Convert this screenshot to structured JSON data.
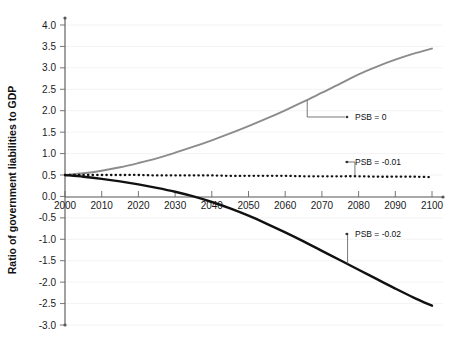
{
  "chart_data": {
    "type": "line",
    "title": "",
    "xlabel": "",
    "ylabel": "Ratio of government liabilities to GDP",
    "xlim": [
      2000,
      2100
    ],
    "ylim": [
      -3.0,
      4.0
    ],
    "grid": true,
    "legend_position": "inline-annotations",
    "x_ticks": [
      2000,
      2010,
      2020,
      2030,
      2040,
      2050,
      2060,
      2070,
      2080,
      2090,
      2100
    ],
    "x_tick_labels": [
      "2000",
      "2010",
      "2020",
      "2030",
      "2040",
      "2050",
      "2060",
      "2070",
      "2080",
      "2090",
      "2100"
    ],
    "y_ticks": [
      -3.0,
      -2.5,
      -2.0,
      -1.5,
      -1.0,
      -0.5,
      0.0,
      0.5,
      1.0,
      1.5,
      2.0,
      2.5,
      3.0,
      3.5,
      4.0
    ],
    "y_tick_labels": [
      "-3.0",
      "-2.5",
      "-2.0",
      "-1.5",
      "-1.0",
      "-0.5",
      "0.0",
      "0.5",
      "1.0",
      "1.5",
      "2.0",
      "2.5",
      "3.0",
      "3.5",
      "4.0"
    ],
    "x": [
      2000,
      2005,
      2010,
      2015,
      2020,
      2025,
      2030,
      2035,
      2040,
      2045,
      2050,
      2055,
      2060,
      2065,
      2070,
      2075,
      2080,
      2085,
      2090,
      2095,
      2100
    ],
    "series": [
      {
        "name": "PSB = 0",
        "style": "solid",
        "color": "#8c8c8c",
        "annotation": "PSB = 0",
        "values": [
          0.5,
          0.54,
          0.6,
          0.68,
          0.78,
          0.89,
          1.02,
          1.16,
          1.31,
          1.47,
          1.64,
          1.82,
          2.01,
          2.21,
          2.42,
          2.63,
          2.85,
          3.03,
          3.19,
          3.33,
          3.45
        ]
      },
      {
        "name": "PSB = -0.01",
        "style": "dotted",
        "color": "#111111",
        "annotation": "PSB = -0.01",
        "values": [
          0.5,
          0.5,
          0.5,
          0.5,
          0.5,
          0.49,
          0.49,
          0.49,
          0.49,
          0.48,
          0.48,
          0.48,
          0.48,
          0.47,
          0.47,
          0.47,
          0.47,
          0.46,
          0.46,
          0.46,
          0.45
        ]
      },
      {
        "name": "PSB = -0.02",
        "style": "solid",
        "color": "#111111",
        "annotation": "PSB = -0.02",
        "values": [
          0.5,
          0.46,
          0.41,
          0.35,
          0.28,
          0.2,
          0.11,
          0.0,
          -0.13,
          -0.28,
          -0.45,
          -0.64,
          -0.84,
          -1.05,
          -1.27,
          -1.49,
          -1.71,
          -1.93,
          -2.15,
          -2.36,
          -2.55
        ]
      }
    ],
    "annotations": [
      {
        "label": "PSB = 0",
        "anchor_year": 2066,
        "anchor_value": 2.24,
        "text_x": 355,
        "text_y": 117
      },
      {
        "label": "PSB = -0.01",
        "anchor_year": 2079,
        "anchor_value": 0.47,
        "text_x": 355,
        "text_y": 162
      },
      {
        "label": "PSB = -0.02",
        "anchor_year": 2077,
        "anchor_value": -1.58,
        "text_x": 355,
        "text_y": 234
      }
    ]
  },
  "colors": {
    "gray_series": "#8c8c8c",
    "black_series": "#111111",
    "axis": "#555555",
    "gridline": "#f0f0f0",
    "background": "#ffffff"
  }
}
